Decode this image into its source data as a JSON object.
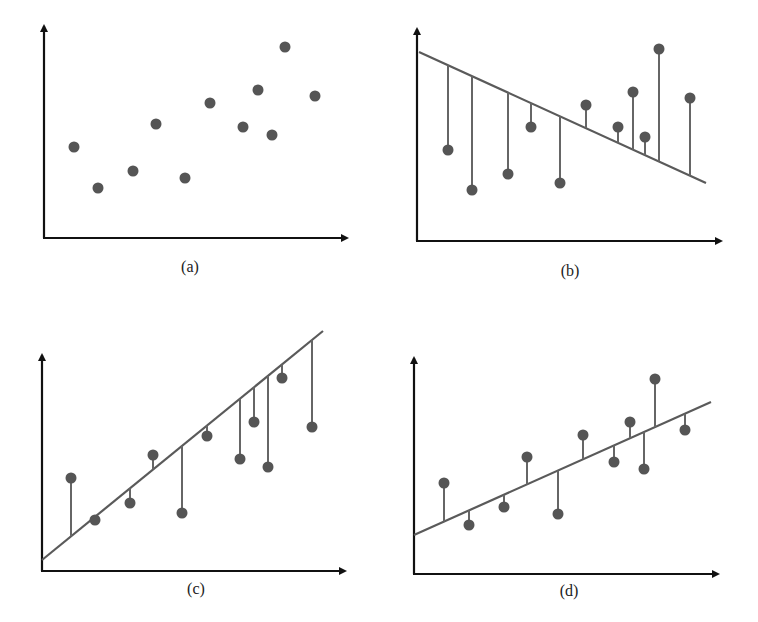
{
  "colors": {
    "axis": "#111111",
    "line": "#5a5a5a",
    "stem": "#666666",
    "point": "#555555",
    "background": "#ffffff"
  },
  "chart_data": [
    {
      "id": "a",
      "type": "scatter",
      "title": "(a)",
      "xlabel": "",
      "ylabel": "",
      "grid": false,
      "axes": {
        "origin": [
          44,
          238
        ],
        "x_end": 353,
        "y_end": 20
      },
      "label": {
        "text": "(a)",
        "x": 190,
        "y": 258
      },
      "fit_line": null,
      "residual_stems": false,
      "points": [
        [
          74,
          147
        ],
        [
          98,
          188
        ],
        [
          133,
          171
        ],
        [
          156,
          124
        ],
        [
          185,
          178
        ],
        [
          210,
          103
        ],
        [
          243,
          127
        ],
        [
          258,
          90
        ],
        [
          272,
          135
        ],
        [
          285,
          47
        ],
        [
          315,
          96
        ]
      ]
    },
    {
      "id": "b",
      "type": "scatter",
      "title": "(b)",
      "xlabel": "",
      "ylabel": "",
      "grid": false,
      "axes": {
        "origin": [
          417,
          241
        ],
        "x_end": 727,
        "y_end": 23
      },
      "label": {
        "text": "(b)",
        "x": 570,
        "y": 262
      },
      "fit_line": {
        "x1": 419,
        "y1": 52,
        "x2": 706,
        "y2": 183,
        "trend": "negative slope"
      },
      "residual_stems": true,
      "points": [
        [
          448,
          150
        ],
        [
          472,
          190
        ],
        [
          508,
          174
        ],
        [
          531,
          127
        ],
        [
          560,
          183
        ],
        [
          586,
          105
        ],
        [
          618,
          127
        ],
        [
          633,
          92
        ],
        [
          645,
          137
        ],
        [
          659,
          49
        ],
        [
          690,
          98
        ]
      ]
    },
    {
      "id": "c",
      "type": "scatter",
      "title": "(c)",
      "xlabel": "",
      "ylabel": "",
      "grid": false,
      "axes": {
        "origin": [
          42,
          571
        ],
        "x_end": 351,
        "y_end": 349
      },
      "label": {
        "text": "(c)",
        "x": 196,
        "y": 580
      },
      "fit_line": {
        "x1": 42,
        "y1": 560,
        "x2": 323,
        "y2": 331,
        "trend": "steep positive slope"
      },
      "residual_stems": true,
      "points": [
        [
          71,
          478
        ],
        [
          95,
          520
        ],
        [
          130,
          503
        ],
        [
          153,
          455
        ],
        [
          182,
          513
        ],
        [
          207,
          436
        ],
        [
          240,
          459
        ],
        [
          254,
          422
        ],
        [
          268,
          467
        ],
        [
          282,
          378
        ],
        [
          312,
          427
        ]
      ]
    },
    {
      "id": "d",
      "type": "scatter",
      "title": "(d)",
      "xlabel": "",
      "ylabel": "",
      "grid": false,
      "axes": {
        "origin": [
          414,
          574
        ],
        "x_end": 724,
        "y_end": 352
      },
      "label": {
        "text": "(d)",
        "x": 569,
        "y": 582
      },
      "fit_line": {
        "x1": 414,
        "y1": 535,
        "x2": 711,
        "y2": 402,
        "trend": "moderate positive slope (best fit)"
      },
      "residual_stems": true,
      "points": [
        [
          444,
          483
        ],
        [
          469,
          525
        ],
        [
          504,
          507
        ],
        [
          527,
          457
        ],
        [
          558,
          514
        ],
        [
          583,
          435
        ],
        [
          614,
          462
        ],
        [
          630,
          422
        ],
        [
          644,
          469
        ],
        [
          655,
          379
        ],
        [
          685,
          430
        ]
      ]
    }
  ],
  "labels": {
    "a": "(a)",
    "b": "(b)",
    "c": "(c)",
    "d": "(d)"
  }
}
